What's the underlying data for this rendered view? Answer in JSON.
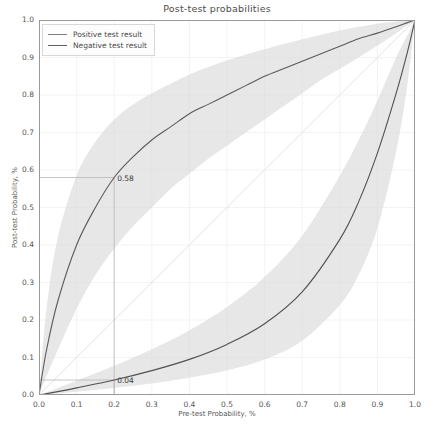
{
  "chart_data": {
    "type": "line",
    "title": "Post-test probabilities",
    "xlabel": "Pre-test Probability, %",
    "ylabel": "Post-test Probability, %",
    "xlim": [
      0,
      1
    ],
    "ylim": [
      0,
      1
    ],
    "grid": true,
    "legend_position": "upper left",
    "xticks": [
      "0.0",
      "0.1",
      "0.2",
      "0.3",
      "0.4",
      "0.5",
      "0.6",
      "0.7",
      "0.8",
      "0.9",
      "1.0"
    ],
    "yticks": [
      "0.0",
      "0.1",
      "0.2",
      "0.3",
      "0.4",
      "0.5",
      "0.6",
      "0.7",
      "0.8",
      "0.9",
      "1.0"
    ],
    "xtick_values": [
      0,
      0.1,
      0.2,
      0.3,
      0.4,
      0.5,
      0.6,
      0.7,
      0.8,
      0.9,
      1.0
    ],
    "ytick_values": [
      0,
      0.1,
      0.2,
      0.3,
      0.4,
      0.5,
      0.6,
      0.7,
      0.8,
      0.9,
      1.0
    ],
    "reference_line": {
      "name": "identity",
      "x": [
        0,
        1
      ],
      "y": [
        0,
        1
      ]
    },
    "series": [
      {
        "name": "Positive test result",
        "color": "#5a5a5a",
        "band_color": "#d9d9d9",
        "x": [
          0.0,
          0.02,
          0.05,
          0.1,
          0.15,
          0.2,
          0.25,
          0.3,
          0.35,
          0.4,
          0.45,
          0.5,
          0.55,
          0.6,
          0.65,
          0.7,
          0.75,
          0.8,
          0.85,
          0.9,
          0.95,
          0.98,
          1.0
        ],
        "y": [
          0.0,
          0.12,
          0.25,
          0.4,
          0.5,
          0.58,
          0.635,
          0.68,
          0.715,
          0.75,
          0.775,
          0.8,
          0.825,
          0.85,
          0.87,
          0.89,
          0.91,
          0.93,
          0.95,
          0.965,
          0.982,
          0.993,
          1.0
        ],
        "y_low": [
          0.0,
          0.05,
          0.12,
          0.23,
          0.32,
          0.39,
          0.45,
          0.5,
          0.55,
          0.59,
          0.63,
          0.665,
          0.7,
          0.735,
          0.77,
          0.805,
          0.84,
          0.87,
          0.9,
          0.932,
          0.965,
          0.986,
          1.0
        ],
        "y_up": [
          0.0,
          0.23,
          0.42,
          0.585,
          0.675,
          0.735,
          0.775,
          0.805,
          0.83,
          0.855,
          0.875,
          0.892,
          0.908,
          0.922,
          0.936,
          0.949,
          0.961,
          0.972,
          0.982,
          0.99,
          0.996,
          0.999,
          1.0
        ]
      },
      {
        "name": "Negative test result",
        "color": "#505050",
        "band_color": "#d9d9d9",
        "x": [
          0.0,
          0.05,
          0.1,
          0.2,
          0.3,
          0.4,
          0.5,
          0.6,
          0.7,
          0.8,
          0.85,
          0.9,
          0.95,
          0.98,
          1.0
        ],
        "y": [
          0.0,
          0.009,
          0.019,
          0.04,
          0.065,
          0.095,
          0.135,
          0.19,
          0.275,
          0.415,
          0.515,
          0.645,
          0.805,
          0.915,
          1.0
        ],
        "y_low": [
          0.0,
          0.004,
          0.009,
          0.019,
          0.031,
          0.046,
          0.066,
          0.095,
          0.145,
          0.24,
          0.32,
          0.445,
          0.65,
          0.83,
          1.0
        ],
        "y_up": [
          0.0,
          0.019,
          0.038,
          0.078,
          0.122,
          0.173,
          0.235,
          0.315,
          0.425,
          0.585,
          0.68,
          0.785,
          0.9,
          0.96,
          1.0
        ]
      }
    ],
    "annotations": [
      {
        "label": "0.58",
        "x": 0.2,
        "y": 0.58,
        "guide": true
      },
      {
        "label": "0.04",
        "x": 0.2,
        "y": 0.04,
        "guide": true
      }
    ]
  },
  "legend": {
    "items": [
      {
        "label": "Positive test result"
      },
      {
        "label": "Negative test result"
      }
    ]
  }
}
